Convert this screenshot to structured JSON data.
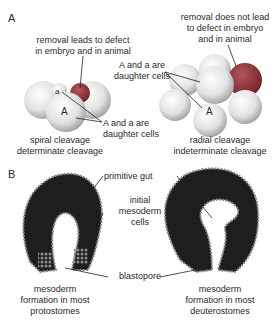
{
  "panel_a": {
    "label": "A",
    "spiral": {
      "removal_note_line1": "removal leads to defect",
      "removal_note_line2": "in embryo and in animal",
      "cell_small": "a",
      "cell_large": "A",
      "daughter_line1": "A and a are",
      "daughter_line2": "daughter cells",
      "caption_line1": "spiral cleavage",
      "caption_line2": "determinate cleavage"
    },
    "radial": {
      "removal_note_line1": "removal does not lead",
      "removal_note_line2": "to defect in embryo",
      "removal_note_line3": "and in animal",
      "daughter_line1": "A and a are",
      "daughter_line2": "daughter cells",
      "cell_small": "a",
      "cell_large": "A",
      "caption_line1": "radial cleavage",
      "caption_line2": "indeterminate cleavage"
    }
  },
  "panel_b": {
    "label": "B",
    "primitive_gut": "primitive gut",
    "initial_mesoderm_line1": "initial",
    "initial_mesoderm_line2": "mesoderm",
    "initial_mesoderm_line3": "cells",
    "blastopore": "blastopore",
    "protostome_caption_line1": "mesoderm",
    "protostome_caption_line2": "formation in most",
    "protostome_caption_line3": "protostomes",
    "deuterostome_caption_line1": "mesoderm",
    "deuterostome_caption_line2": "formation in most",
    "deuterostome_caption_line3": "deuterostomes"
  },
  "colors": {
    "cell_light": "#e8e8e8",
    "cell_dark": "#8a2f35",
    "embryo_dark": "#1e1e1e",
    "cell_bead": "#8c8c8c",
    "text": "#2a2a2a"
  }
}
